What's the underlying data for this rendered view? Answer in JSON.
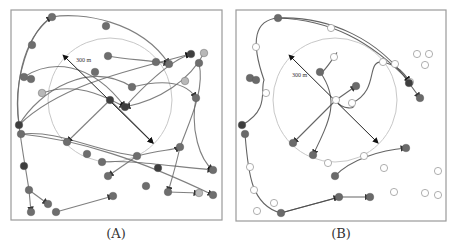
{
  "figure": {
    "panels": [
      {
        "id": "A",
        "caption": "(A)",
        "frame": {
          "x": 11,
          "y": 10,
          "w": 211,
          "h": 210
        },
        "range_circle": {
          "cx": 110,
          "cy": 100,
          "r": 62,
          "color": "#c8c8c8"
        },
        "diameter_label": "300 m",
        "diameter_label_pos": {
          "x": 76,
          "y": 62
        },
        "diameter_arrow": {
          "x1": 66,
          "y1": 58,
          "x2": 153,
          "y2": 143
        },
        "colors": {
          "path": "#6a6a6a",
          "node": "#6e6e6e",
          "dark_node": "#3e3e3e",
          "light_node": "#b8b8b8"
        },
        "nodes": [
          [
            52,
            17,
            "n"
          ],
          [
            106,
            26,
            "n"
          ],
          [
            32,
            45,
            "n"
          ],
          [
            24,
            77,
            "n"
          ],
          [
            31,
            79,
            "n"
          ],
          [
            42,
            93,
            "l"
          ],
          [
            108,
            56,
            "n"
          ],
          [
            156,
            62,
            "n"
          ],
          [
            169,
            64,
            "n"
          ],
          [
            191,
            54,
            "d"
          ],
          [
            204,
            53,
            "l"
          ],
          [
            199,
            63,
            "n"
          ],
          [
            95,
            72,
            "n"
          ],
          [
            132,
            87,
            "n"
          ],
          [
            185,
            81,
            "l"
          ],
          [
            110,
            100,
            "d"
          ],
          [
            125,
            107,
            "d"
          ],
          [
            196,
            98,
            "n"
          ],
          [
            19,
            125,
            "d"
          ],
          [
            21,
            134,
            "n"
          ],
          [
            67,
            142,
            "n"
          ],
          [
            87,
            154,
            "n"
          ],
          [
            102,
            162,
            "n"
          ],
          [
            137,
            156,
            "n"
          ],
          [
            180,
            147,
            "n"
          ],
          [
            24,
            166,
            "d"
          ],
          [
            108,
            176,
            "n"
          ],
          [
            158,
            168,
            "d"
          ],
          [
            146,
            186,
            "n"
          ],
          [
            213,
            170,
            "n"
          ],
          [
            29,
            190,
            "n"
          ],
          [
            48,
            204,
            "n"
          ],
          [
            31,
            212,
            "n"
          ],
          [
            56,
            212,
            "n"
          ],
          [
            113,
            196,
            "n"
          ],
          [
            168,
            192,
            "n"
          ],
          [
            199,
            193,
            "l"
          ],
          [
            213,
            195,
            "n"
          ]
        ],
        "paths": [
          "M19,125 C15,90 20,40 52,17 C80,12 140,20 169,64",
          "M19,125 C12,80 30,30 52,17",
          "M19,125 C40,90 90,60 132,87 C160,80 185,80 196,98",
          "M19,125 C60,85 130,70 191,54",
          "M24,77 C50,60 90,60 125,107",
          "M21,134 C60,130 90,150 137,156 C160,150 175,150 180,147",
          "M21,134 C80,140 140,160 213,195",
          "M19,125 C22,150 26,170 29,190 L31,212",
          "M29,190 L48,204",
          "M56,212 L113,196",
          "M108,56 C130,60 150,60 169,64",
          "M125,107 C140,90 170,60 191,54",
          "M110,100 L67,142",
          "M110,100 L153,143",
          "M199,63 C205,90 190,120 180,147 C175,170 170,185 168,192",
          "M196,98 C190,130 200,160 213,170",
          "M137,156 L108,176",
          "M102,162 C130,160 160,165 213,170",
          "M168,192 L199,193",
          "M42,93 C80,80 110,100 125,107",
          "M204,53 C190,80 160,100 125,107"
        ]
      },
      {
        "id": "B",
        "caption": "(B)",
        "frame": {
          "x": 236,
          "y": 10,
          "w": 210,
          "h": 211
        },
        "range_circle": {
          "cx": 335,
          "cy": 100,
          "r": 62,
          "color": "#c8c8c8"
        },
        "diameter_label": "300 m",
        "diameter_label_pos": {
          "x": 292,
          "y": 77
        },
        "diameter_arrow": {
          "x1": 292,
          "y1": 58,
          "x2": 378,
          "y2": 143
        },
        "colors": {
          "path": "#4a4a4a",
          "node": "#6a6a6a",
          "dark_node": "#3e3e3e",
          "open_marker": "#9a9a9a"
        },
        "nodes": [
          [
            278,
            18,
            "n"
          ],
          [
            250,
            78,
            "n"
          ],
          [
            256,
            80,
            "n"
          ],
          [
            320,
            72,
            "n"
          ],
          [
            356,
            86,
            "n"
          ],
          [
            409,
            83,
            "d"
          ],
          [
            420,
            98,
            "n"
          ],
          [
            242,
            125,
            "d"
          ],
          [
            245,
            134,
            "n"
          ],
          [
            293,
            143,
            "n"
          ],
          [
            313,
            155,
            "n"
          ],
          [
            406,
            148,
            "n"
          ],
          [
            335,
            176,
            "n"
          ],
          [
            370,
            197,
            "n"
          ],
          [
            339,
            197,
            "n"
          ],
          [
            281,
            213,
            "n"
          ]
        ],
        "open_markers": [
          [
            331,
            28
          ],
          [
            256,
            47
          ],
          [
            334,
            57
          ],
          [
            417,
            54
          ],
          [
            429,
            54
          ],
          [
            425,
            65
          ],
          [
            383,
            62
          ],
          [
            395,
            64
          ],
          [
            410,
            82
          ],
          [
            266,
            93
          ],
          [
            352,
            103
          ],
          [
            336,
            100
          ],
          [
            364,
            156
          ],
          [
            328,
            163
          ],
          [
            250,
            167
          ],
          [
            384,
            168
          ],
          [
            438,
            171
          ],
          [
            254,
            190
          ],
          [
            274,
            203
          ],
          [
            257,
            211
          ],
          [
            394,
            192
          ],
          [
            425,
            193
          ],
          [
            438,
            195
          ]
        ],
        "paths": [
          "M242,125 C270,110 260,90 264,80 C250,40 255,20 278,18 C330,16 380,40 409,83 L420,98",
          "M278,18 C330,20 370,40 410,82",
          "M334,57 C345,40 320,80 320,72 C340,100 330,120 313,155",
          "M336,100 L356,86",
          "M336,100 L293,143",
          "M336,100 C340,110 360,110 352,103 C380,90 365,60 383,62 C400,66 405,75 410,82",
          "M245,134 C248,170 250,205 281,213 C310,205 330,200 339,197 L370,197",
          "M281,213 L339,197",
          "M335,176 C350,160 380,150 406,148"
        ]
      }
    ]
  }
}
